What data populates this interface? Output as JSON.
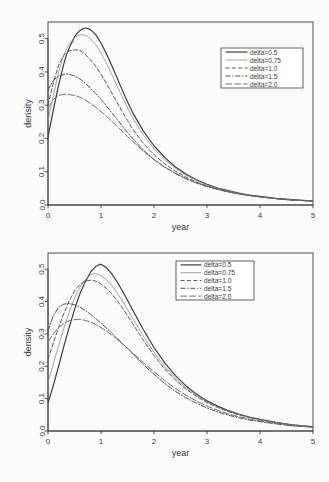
{
  "figure": {
    "background": "#fbfbfa",
    "ink": "#3a3a3a",
    "panel_count": 2
  },
  "chart_data": [
    {
      "type": "line",
      "title": "",
      "subtitle": "",
      "xlabel": "year",
      "ylabel": "density",
      "xlim": [
        0,
        5
      ],
      "ylim": [
        0.0,
        0.55
      ],
      "xticks": [
        "0",
        "1",
        "2",
        "3",
        "4",
        "5"
      ],
      "xtick_values": [
        0,
        1,
        2,
        3,
        4,
        5
      ],
      "yticks": [
        "0.0",
        "0.1",
        "0.2",
        "0.3",
        "0.4",
        "0.5"
      ],
      "ytick_values": [
        0.0,
        0.1,
        0.2,
        0.3,
        0.4,
        0.5
      ],
      "grid": false,
      "legend_position": "top-right",
      "legend_entries": [
        "delta=0.5",
        "delta=0.75",
        "delta=1.0",
        "delta=1.5",
        "delta=2.0"
      ],
      "x": [
        0,
        0.1,
        0.2,
        0.3,
        0.35,
        0.4,
        0.5,
        0.55,
        0.6,
        0.65,
        0.7,
        0.72,
        0.8,
        0.9,
        1.0,
        1.1,
        1.2,
        1.3,
        1.4,
        1.5,
        1.6,
        1.8,
        2.0,
        2.2,
        2.4,
        2.6,
        2.8,
        3.0,
        3.2,
        3.4,
        3.6,
        3.8,
        4.0,
        4.3,
        4.6,
        5.0
      ],
      "series": [
        {
          "name": "delta=0.5",
          "style": "solid",
          "width": 1.2,
          "color": "#3c3c3c",
          "peak_x": 0.72,
          "peak_y": 0.532,
          "values": [
            0.205,
            0.285,
            0.36,
            0.425,
            0.452,
            0.472,
            0.505,
            0.516,
            0.524,
            0.529,
            0.532,
            0.532,
            0.527,
            0.512,
            0.487,
            0.455,
            0.42,
            0.383,
            0.346,
            0.31,
            0.277,
            0.222,
            0.178,
            0.143,
            0.115,
            0.093,
            0.076,
            0.062,
            0.051,
            0.043,
            0.036,
            0.03,
            0.026,
            0.02,
            0.016,
            0.012
          ]
        },
        {
          "name": "delta=0.75",
          "style": "thin-solid",
          "width": 0.8,
          "color": "#8e8e8e",
          "peak_x": 0.64,
          "peak_y": 0.512,
          "values": [
            0.252,
            0.33,
            0.4,
            0.452,
            0.47,
            0.484,
            0.503,
            0.508,
            0.511,
            0.512,
            0.51,
            0.509,
            0.5,
            0.482,
            0.457,
            0.427,
            0.394,
            0.359,
            0.325,
            0.292,
            0.261,
            0.21,
            0.169,
            0.137,
            0.111,
            0.09,
            0.074,
            0.06,
            0.05,
            0.042,
            0.035,
            0.03,
            0.025,
            0.019,
            0.015,
            0.012
          ]
        },
        {
          "name": "delta=1.0",
          "style": "dashed",
          "width": 1.0,
          "color": "#5a5a5a",
          "peak_x": 0.55,
          "peak_y": 0.466,
          "values": [
            0.3,
            0.368,
            0.42,
            0.45,
            0.458,
            0.463,
            0.466,
            0.466,
            0.464,
            0.46,
            0.453,
            0.45,
            0.437,
            0.417,
            0.393,
            0.366,
            0.338,
            0.309,
            0.281,
            0.254,
            0.228,
            0.185,
            0.151,
            0.124,
            0.102,
            0.084,
            0.069,
            0.057,
            0.048,
            0.04,
            0.034,
            0.029,
            0.025,
            0.019,
            0.015,
            0.012
          ]
        },
        {
          "name": "delta=1.5",
          "style": "dash-dot",
          "width": 1.0,
          "color": "#505050",
          "peak_x": 0.38,
          "peak_y": 0.394,
          "values": [
            0.345,
            0.374,
            0.388,
            0.393,
            0.394,
            0.393,
            0.388,
            0.384,
            0.379,
            0.373,
            0.366,
            0.363,
            0.351,
            0.335,
            0.317,
            0.298,
            0.278,
            0.258,
            0.238,
            0.218,
            0.199,
            0.165,
            0.137,
            0.114,
            0.095,
            0.079,
            0.066,
            0.055,
            0.047,
            0.039,
            0.033,
            0.028,
            0.024,
            0.019,
            0.015,
            0.012
          ]
        },
        {
          "name": "delta=2.0",
          "style": "long-dash",
          "width": 1.0,
          "color": "#6e6e6e",
          "peak_x": 0.35,
          "peak_y": 0.333,
          "values": [
            0.29,
            0.317,
            0.329,
            0.333,
            0.333,
            0.332,
            0.329,
            0.327,
            0.324,
            0.32,
            0.316,
            0.314,
            0.305,
            0.294,
            0.281,
            0.267,
            0.252,
            0.237,
            0.222,
            0.206,
            0.191,
            0.162,
            0.136,
            0.114,
            0.096,
            0.08,
            0.067,
            0.057,
            0.048,
            0.04,
            0.034,
            0.029,
            0.024,
            0.019,
            0.015,
            0.011
          ]
        }
      ]
    },
    {
      "type": "line",
      "title": "",
      "subtitle": "",
      "xlabel": "year",
      "ylabel": "density",
      "xlim": [
        0,
        5
      ],
      "ylim": [
        0.0,
        0.55
      ],
      "xticks": [
        "0",
        "1",
        "2",
        "3",
        "4",
        "5"
      ],
      "xtick_values": [
        0,
        1,
        2,
        3,
        4,
        5
      ],
      "yticks": [
        "0.0",
        "0.1",
        "0.2",
        "0.3",
        "0.4",
        "0.5"
      ],
      "ytick_values": [
        0.0,
        0.1,
        0.2,
        0.3,
        0.4,
        0.5
      ],
      "grid": false,
      "legend_position": "top-right",
      "legend_entries": [
        "delta=0.5",
        "delta=0.75",
        "delta=1.0",
        "delta=1.5",
        "delta=2.0"
      ],
      "x": [
        0,
        0.1,
        0.2,
        0.3,
        0.4,
        0.5,
        0.55,
        0.6,
        0.7,
        0.8,
        0.85,
        0.9,
        0.98,
        1.0,
        1.1,
        1.2,
        1.3,
        1.4,
        1.5,
        1.6,
        1.8,
        2.0,
        2.2,
        2.4,
        2.6,
        2.8,
        3.0,
        3.2,
        3.4,
        3.6,
        3.8,
        4.0,
        4.3,
        4.6,
        5.0
      ],
      "series": [
        {
          "name": "delta=0.5",
          "style": "solid",
          "width": 1.2,
          "color": "#3c3c3c",
          "peak_x": 0.98,
          "peak_y": 0.515,
          "values": [
            0.086,
            0.14,
            0.2,
            0.262,
            0.32,
            0.375,
            0.4,
            0.423,
            0.46,
            0.49,
            0.5,
            0.508,
            0.515,
            0.515,
            0.505,
            0.486,
            0.462,
            0.434,
            0.404,
            0.373,
            0.313,
            0.258,
            0.211,
            0.172,
            0.14,
            0.114,
            0.093,
            0.077,
            0.063,
            0.052,
            0.043,
            0.036,
            0.027,
            0.019,
            0.013
          ]
        },
        {
          "name": "delta=0.75",
          "style": "thin-solid",
          "width": 0.8,
          "color": "#8e8e8e",
          "peak_x": 0.85,
          "peak_y": 0.486,
          "values": [
            0.15,
            0.207,
            0.264,
            0.318,
            0.367,
            0.41,
            0.428,
            0.444,
            0.468,
            0.482,
            0.486,
            0.486,
            0.482,
            0.48,
            0.468,
            0.45,
            0.428,
            0.403,
            0.376,
            0.348,
            0.293,
            0.243,
            0.2,
            0.164,
            0.134,
            0.11,
            0.09,
            0.074,
            0.061,
            0.051,
            0.042,
            0.035,
            0.026,
            0.019,
            0.013
          ]
        },
        {
          "name": "delta=1.0",
          "style": "dashed",
          "width": 1.0,
          "color": "#5a5a5a",
          "peak_x": 0.8,
          "peak_y": 0.466,
          "values": [
            0.222,
            0.272,
            0.32,
            0.364,
            0.402,
            0.432,
            0.443,
            0.452,
            0.463,
            0.466,
            0.465,
            0.463,
            0.456,
            0.454,
            0.441,
            0.424,
            0.404,
            0.381,
            0.357,
            0.331,
            0.28,
            0.233,
            0.192,
            0.158,
            0.13,
            0.107,
            0.088,
            0.073,
            0.06,
            0.05,
            0.042,
            0.035,
            0.026,
            0.019,
            0.013
          ]
        },
        {
          "name": "delta=1.5",
          "style": "dash-dot",
          "width": 1.0,
          "color": "#505050",
          "peak_x": 0.4,
          "peak_y": 0.394,
          "values": [
            0.31,
            0.356,
            0.382,
            0.392,
            0.394,
            0.39,
            0.387,
            0.383,
            0.373,
            0.361,
            0.354,
            0.347,
            0.336,
            0.333,
            0.318,
            0.303,
            0.287,
            0.271,
            0.255,
            0.238,
            0.205,
            0.175,
            0.147,
            0.123,
            0.103,
            0.086,
            0.071,
            0.059,
            0.049,
            0.041,
            0.034,
            0.029,
            0.022,
            0.016,
            0.012
          ]
        },
        {
          "name": "delta=2.0",
          "style": "long-dash",
          "width": 1.0,
          "color": "#6e6e6e",
          "peak_x": 0.55,
          "peak_y": 0.345,
          "values": [
            0.275,
            0.3,
            0.32,
            0.333,
            0.341,
            0.344,
            0.345,
            0.345,
            0.342,
            0.337,
            0.333,
            0.329,
            0.322,
            0.32,
            0.309,
            0.297,
            0.284,
            0.27,
            0.256,
            0.241,
            0.211,
            0.183,
            0.156,
            0.132,
            0.111,
            0.093,
            0.077,
            0.064,
            0.053,
            0.044,
            0.037,
            0.031,
            0.023,
            0.017,
            0.012
          ]
        }
      ]
    }
  ]
}
